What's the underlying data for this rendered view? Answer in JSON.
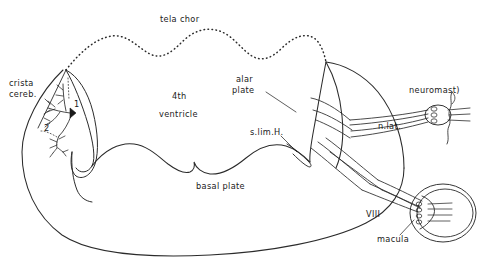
{
  "figure": {
    "title": "tela chor",
    "type": "neuroanatomical-schematic"
  },
  "labels": {
    "tela_chor": "tela chor",
    "crista_cereb_line1": "crista",
    "crista_cereb_line2": "cereb.",
    "fourth": "4th",
    "ventricle": "ventricle",
    "alar_line1": "alar",
    "alar_line2": "plate",
    "basal_plate": "basal plate",
    "s_lim_h": "s.lim.H.",
    "n_lat": "n.lat.",
    "neuromast": "neuromast)",
    "nerve_viii": "VIII",
    "macula": "macula",
    "marker_one": "1",
    "marker_two": "2"
  },
  "colors": {
    "ink": "#1a1a1a",
    "stroke": "#2b2b2b",
    "background": "#ffffff"
  }
}
